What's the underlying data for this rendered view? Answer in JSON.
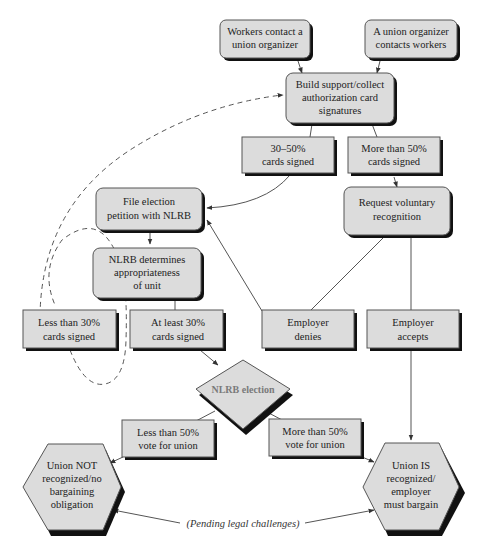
{
  "colors": {
    "fill": "#dcdcdc",
    "stroke": "#555555",
    "shadow": "#111111",
    "line": "#555555",
    "text": "#222222",
    "election_text": "#7a7a7a"
  },
  "nodes": {
    "workers_contact": {
      "lines": [
        "Workers contact a",
        "union organizer"
      ]
    },
    "organizer_contacts": {
      "lines": [
        "A union organizer",
        "contacts workers"
      ]
    },
    "build_support": {
      "lines": [
        "Build support/collect",
        "authorization card",
        "signatures"
      ]
    },
    "cards_30_50": {
      "lines": [
        "30–50%",
        "cards signed"
      ]
    },
    "cards_over_50": {
      "lines": [
        "More than 50%",
        "cards signed"
      ]
    },
    "file_petition": {
      "lines": [
        "File election",
        "petition with NLRB"
      ]
    },
    "request_voluntary": {
      "lines": [
        "Request voluntary",
        "recognition"
      ]
    },
    "nlrb_determines": {
      "lines": [
        "NLRB determines",
        "appropriateness",
        "of unit"
      ]
    },
    "less_30": {
      "lines": [
        "Less than 30%",
        "cards signed"
      ]
    },
    "at_least_30": {
      "lines": [
        "At least 30%",
        "cards signed"
      ]
    },
    "employer_denies": {
      "lines": [
        "Employer",
        "denies"
      ]
    },
    "employer_accepts": {
      "lines": [
        "Employer",
        "accepts"
      ]
    },
    "nlrb_election": {
      "lines": [
        "NLRB election"
      ]
    },
    "less_50_vote": {
      "lines": [
        "Less than 50%",
        "vote for union"
      ]
    },
    "more_50_vote": {
      "lines": [
        "More than 50%",
        "vote for union"
      ]
    },
    "union_not": {
      "lines": [
        "Union NOT",
        "recognized/no",
        "bargaining",
        "obligation"
      ]
    },
    "union_is": {
      "lines": [
        "Union IS",
        "recognized/",
        "employer",
        "must bargain"
      ]
    }
  },
  "annotations": {
    "pending": "(Pending legal challenges)"
  }
}
